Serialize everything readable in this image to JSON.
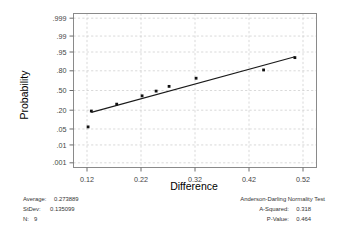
{
  "chart_data": {
    "type": "scatter",
    "title": "",
    "xlabel": "Difference",
    "ylabel": "Probability",
    "xlim": [
      0.095,
      0.545
    ],
    "xticks": [
      0.12,
      0.22,
      0.32,
      0.42,
      0.52
    ],
    "xtick_labels": [
      "0.12",
      "0.22",
      "0.32",
      "0.42",
      "0.52"
    ],
    "yscale": "normal-probability",
    "yticks": [
      0.001,
      0.01,
      0.05,
      0.2,
      0.5,
      0.8,
      0.95,
      0.99,
      0.999
    ],
    "ytick_labels": [
      ".001",
      ".01",
      ".05",
      ".20",
      ".50",
      ".80",
      ".95",
      ".99",
      ".999"
    ],
    "grid": true,
    "legend": null,
    "x": [
      0.122,
      0.128,
      0.175,
      0.222,
      0.248,
      0.272,
      0.322,
      0.447,
      0.505
    ],
    "y": [
      0.06,
      0.19,
      0.28,
      0.41,
      0.49,
      0.57,
      0.7,
      0.81,
      0.92
    ],
    "series": [
      {
        "name": "Normal probability plot points",
        "x": [
          0.122,
          0.128,
          0.175,
          0.222,
          0.248,
          0.272,
          0.322,
          0.447,
          0.505
        ],
        "values": [
          0.06,
          0.19,
          0.28,
          0.41,
          0.49,
          0.57,
          0.7,
          0.81,
          0.92
        ]
      },
      {
        "name": "Fitted normal line",
        "type": "line",
        "x": [
          0.128,
          0.505
        ],
        "values": [
          0.175,
          0.925
        ]
      }
    ]
  },
  "axes": {
    "x_title": "Difference",
    "y_title": "Probability"
  },
  "stats_left": {
    "average_label": "Average:",
    "average_value": "0.273889",
    "stdev_label": "StDev:",
    "stdev_value": "0.135099",
    "n_label": "N:",
    "n_value": "9"
  },
  "stats_right": {
    "test_title": "Anderson-Darling Normality Test",
    "a_squared_label": "A-Squared:",
    "a_squared_value": "0.318",
    "p_value_label": "P-Value:",
    "p_value_value": "0.464"
  },
  "colors": {
    "frame": "#8a8a8a",
    "grid": "#c9c9c9",
    "point": "#111111",
    "line": "#1a1a1a",
    "text": "#333333",
    "background": "#ffffff"
  }
}
